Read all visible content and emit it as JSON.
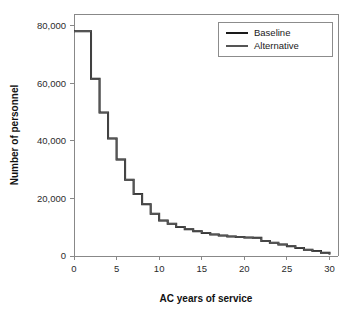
{
  "chart_data": {
    "type": "line",
    "subtype": "step",
    "title": "",
    "xlabel": "AC years of service",
    "ylabel": "Number of personnel",
    "xlim": [
      0,
      31
    ],
    "ylim": [
      0,
      84000
    ],
    "grid": false,
    "legend_position": "top-right",
    "x_ticks": [
      0,
      5,
      10,
      15,
      20,
      25,
      30
    ],
    "x_tick_labels": [
      "0",
      "5",
      "10",
      "15",
      "20",
      "25",
      "30"
    ],
    "y_ticks": [
      0,
      20000,
      40000,
      60000,
      80000
    ],
    "y_tick_labels": [
      "0",
      "20,000",
      "40,000",
      "60,000",
      "80,000"
    ],
    "x": [
      0,
      1,
      2,
      3,
      4,
      5,
      6,
      7,
      8,
      9,
      10,
      11,
      12,
      13,
      14,
      15,
      16,
      17,
      18,
      19,
      20,
      21,
      22,
      23,
      24,
      25,
      26,
      27,
      28,
      29,
      30
    ],
    "series": [
      {
        "name": "Baseline",
        "color": "#1a1a1a",
        "values": [
          78000,
          78000,
          61500,
          49800,
          40800,
          33500,
          26500,
          21500,
          18000,
          14700,
          12300,
          11200,
          10100,
          9300,
          8600,
          8000,
          7500,
          7100,
          6800,
          6600,
          6400,
          6300,
          5200,
          4600,
          4000,
          3400,
          2800,
          2200,
          1700,
          1100,
          500
        ]
      },
      {
        "name": "Alternative",
        "color": "#555555",
        "values": [
          78000,
          78000,
          61500,
          49800,
          40800,
          33500,
          26500,
          21500,
          18000,
          14700,
          12300,
          11200,
          10100,
          9300,
          8600,
          8000,
          7500,
          7100,
          6800,
          6600,
          6400,
          6300,
          5200,
          4600,
          4000,
          3400,
          2800,
          2200,
          1700,
          1100,
          500
        ]
      }
    ],
    "legend": [
      {
        "label": "Baseline",
        "color": "#1a1a1a"
      },
      {
        "label": "Alternative",
        "color": "#555555"
      }
    ]
  }
}
